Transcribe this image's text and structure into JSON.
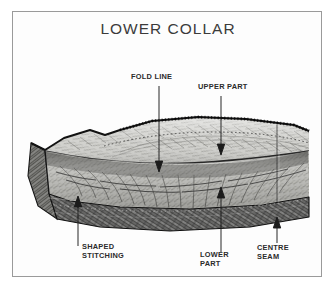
{
  "figure": {
    "title": "LOWER COLLAR",
    "border_color": "#9a9a9a",
    "background_color": "#fdfdfd",
    "title_color": "#3b3b3b",
    "ink_color": "#1a1a1a"
  },
  "labels": {
    "fold_line": "FOLD LINE",
    "upper_part": "UPPER PART",
    "shaped_stitching": "SHAPED\nSTITCHING",
    "lower_part": "LOWER\nPART",
    "centre_seam": "CENTRE\nSEAM"
  }
}
